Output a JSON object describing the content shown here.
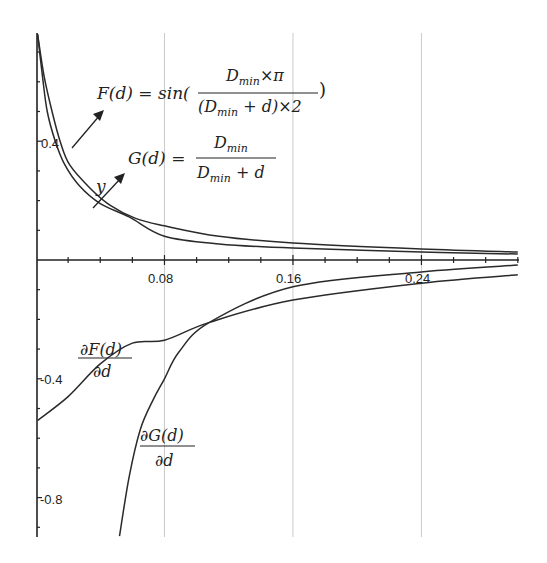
{
  "chart_data": {
    "type": "line",
    "title": "",
    "xlabel": "d",
    "ylabel": "",
    "xlim": [
      0,
      0.3
    ],
    "ylim": [
      -0.94,
      0.77
    ],
    "grid": {
      "vertical": [
        0.08,
        0.16,
        0.24
      ],
      "horizontal": false
    },
    "x_ticks": [
      0.08,
      0.16,
      0.24
    ],
    "x_tick_labels": [
      "0.08",
      "0.16",
      "0.24"
    ],
    "y_ticks": [
      0.4,
      -0.4,
      -0.8
    ],
    "y_tick_labels": [
      "0.4",
      "-0.4",
      "-0.8"
    ],
    "pixel_mapping": {
      "x0_px": 36,
      "px_per_x_unit": 1606,
      "y0_px": 260,
      "px_per_y_unit": 297
    },
    "series": [
      {
        "name": "F(d)",
        "formula": "F(d) = sin(Dmin×π / ((Dmin + d)×2))",
        "x": [
          0.001,
          0.005,
          0.01,
          0.015,
          0.021,
          0.034,
          0.046,
          0.062,
          0.08,
          0.114,
          0.16,
          0.24,
          0.3
        ],
        "values": [
          0.76,
          0.62,
          0.5,
          0.4,
          0.32,
          0.24,
          0.185,
          0.14,
          0.115,
          0.08,
          0.057,
          0.037,
          0.027
        ]
      },
      {
        "name": "G(d)",
        "formula": "G(d) = Dmin / (Dmin + d)",
        "x": [
          0.001,
          0.004,
          0.007,
          0.012,
          0.018,
          0.027,
          0.04,
          0.058,
          0.08,
          0.114,
          0.16,
          0.24,
          0.3
        ],
        "values": [
          0.76,
          0.62,
          0.5,
          0.4,
          0.32,
          0.25,
          0.19,
          0.145,
          0.08,
          0.054,
          0.04,
          0.027,
          0.02
        ]
      },
      {
        "name": "∂F(d)/∂d",
        "x": [
          0.001,
          0.02,
          0.04,
          0.06,
          0.08,
          0.108,
          0.16,
          0.24,
          0.3
        ],
        "values": [
          -0.54,
          -0.46,
          -0.35,
          -0.28,
          -0.27,
          -0.21,
          -0.135,
          -0.078,
          -0.05
        ]
      },
      {
        "name": "∂G(d)/∂d",
        "x": [
          0.052,
          0.058,
          0.065,
          0.073,
          0.08,
          0.089,
          0.108,
          0.16,
          0.24,
          0.3
        ],
        "values": [
          -0.93,
          -0.73,
          -0.57,
          -0.47,
          -0.4,
          -0.31,
          -0.21,
          -0.09,
          -0.04,
          -0.017
        ]
      }
    ],
    "annotations": [
      {
        "text": "F(d) = sin(Dmin×π / ((Dmin + d)×2))",
        "arrow": true
      },
      {
        "text": "G(d) = Dmin / (Dmin + d)",
        "arrow": true
      },
      {
        "text": "y",
        "note": "label near G arrow"
      },
      {
        "text": "∂F(d)/∂d"
      },
      {
        "text": "∂G(d)/∂d"
      }
    ]
  },
  "labels": {
    "x_ticks": [
      "0.08",
      "0.16",
      "0.24"
    ],
    "y_ticks": [
      "0.4",
      "-0.4",
      "-0.8"
    ],
    "F_lhs": "F(d) = sin(",
    "F_num": "D",
    "F_num_sub": "min",
    "F_num_rest": "×π",
    "F_den": "(D",
    "F_den_sub": "min",
    "F_den_rest": " + d)×2",
    "F_close": ")",
    "G_lhs": "G(d) = ",
    "G_num": "D",
    "G_num_sub": "min",
    "G_den": "D",
    "G_den_sub": "min",
    "G_den_rest": " + d",
    "y_label": "y",
    "dF_num": "∂F(d)",
    "dF_den": "∂d",
    "dG_num": "∂G(d)",
    "dG_den": "∂d"
  },
  "style": {
    "line_color": "#2a2a2a",
    "grid_color": "#bdbdbd",
    "axis_color": "#222222"
  }
}
